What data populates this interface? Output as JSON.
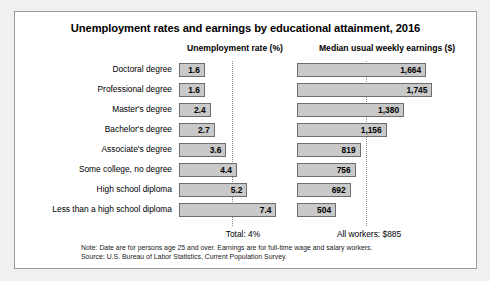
{
  "chart_data": {
    "type": "bar",
    "title": "Unemployment rates and earnings by educational attainment, 2016",
    "orientation": "horizontal",
    "categories": [
      "Doctoral degree",
      "Professional degree",
      "Master's degree",
      "Bachelor's degree",
      "Associate's degree",
      "Some college, no degree",
      "High school diploma",
      "Less than a high school diploma"
    ],
    "series": [
      {
        "name": "Unemployment rate (%)",
        "unit": "percent",
        "values": [
          1.6,
          1.6,
          2.4,
          2.7,
          3.6,
          4.4,
          5.2,
          7.4
        ],
        "labels": [
          "1.6",
          "1.6",
          "2.4",
          "2.7",
          "3.6",
          "4.4",
          "5.2",
          "7.4"
        ],
        "reference_line": 4,
        "reference_label": "Total: 4%",
        "axis_max": 8.2
      },
      {
        "name": "Median usual weekly earnings ($)",
        "unit": "dollars",
        "values": [
          1664,
          1745,
          1380,
          1156,
          819,
          756,
          692,
          504
        ],
        "labels": [
          "1,664",
          "1,745",
          "1,380",
          "1,156",
          "819",
          "756",
          "692",
          "504"
        ],
        "reference_line": 885,
        "reference_label": "All workers: $885",
        "axis_max": 1830
      }
    ],
    "grid": false,
    "legend": "none",
    "notes": [
      "Note: Date are for persons age 25 and over. Earnings are for full-time wage and salary workers.",
      "Source: U.S. Bureau of Labor Statistics, Current Population Survey."
    ],
    "colors": {
      "bar_fill": "#c9c9c9",
      "bar_border": "#6e6e6e",
      "frame_border": "#9a9a9a",
      "page_background": "#f0f0ef",
      "chart_background": "#ffffff",
      "reference_line": "#8a8a8a",
      "text": "#000000"
    }
  },
  "headers": {
    "unemployment": "Unemployment rate (%)",
    "earnings": "Median usual weekly earnings ($)"
  }
}
